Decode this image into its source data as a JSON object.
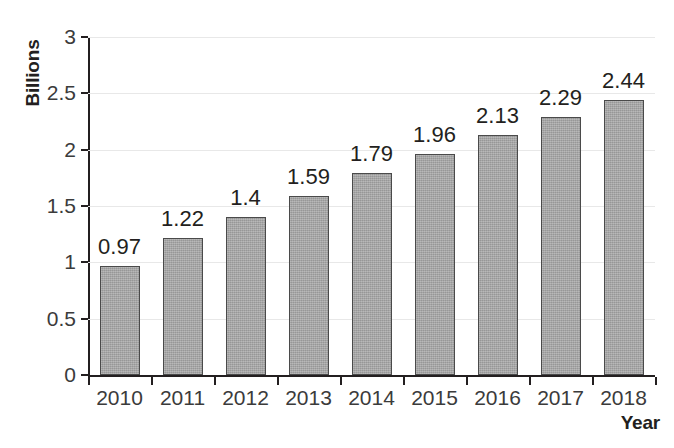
{
  "chart_data": {
    "type": "bar",
    "title": "",
    "subtitle": "",
    "xlabel": "Year",
    "ylabel": "Billions",
    "categories": [
      "2010",
      "2011",
      "2012",
      "2013",
      "2014",
      "2015",
      "2016",
      "2017",
      "2018"
    ],
    "values": [
      0.97,
      1.22,
      1.4,
      1.59,
      1.79,
      1.96,
      2.13,
      2.29,
      2.44
    ],
    "value_labels": [
      "0.97",
      "1.22",
      "1.4",
      "1.59",
      "1.79",
      "1.96",
      "2.13",
      "2.29",
      "2.44"
    ],
    "ylim": [
      0,
      3
    ],
    "ytick_values": [
      0,
      0.5,
      1,
      1.5,
      2,
      2.5,
      3
    ],
    "ytick_labels": [
      "0",
      "0.5",
      "1",
      "1.5",
      "2",
      "2.5",
      "3"
    ],
    "xlim_note": "categorical",
    "grid": "horizontal",
    "legend": "none",
    "series": [
      {
        "name": "",
        "values": [
          0.97,
          1.22,
          1.4,
          1.59,
          1.79,
          1.96,
          2.13,
          2.29,
          2.44
        ]
      }
    ],
    "colors": {
      "bar_fill": "#a5a5a5",
      "bar_border": "#4a4a4a",
      "axis": "#231f20",
      "gridline": "#e8e8e8",
      "tick_text": "#3b3b3b",
      "value_text": "#231f20",
      "background": "#ffffff"
    }
  }
}
